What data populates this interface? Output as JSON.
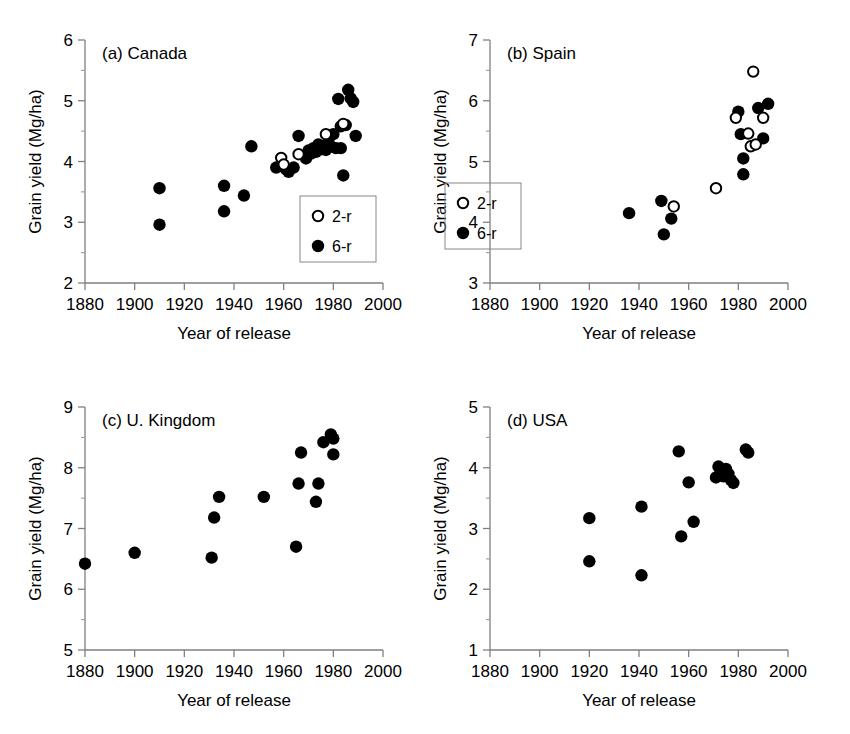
{
  "figure": {
    "title": "",
    "background_color": "#ffffff",
    "panel_count": 4
  },
  "common": {
    "xlabel": "Year of release",
    "ylabel": "Grain yield (Mg/ha)",
    "xticks": [
      1880,
      1900,
      1920,
      1940,
      1960,
      1980,
      2000
    ],
    "xlim": [
      1880,
      2000
    ],
    "legend_entries": [
      {
        "label": "2-r",
        "marker": "open-circle"
      },
      {
        "label": "6-r",
        "marker": "filled-circle"
      }
    ]
  },
  "chart_data": [
    {
      "type": "scatter",
      "id": "panel-a",
      "title": "(a) Canada",
      "xlabel": "Year of release",
      "ylabel": "Grain yield (Mg/ha)",
      "xlim": [
        1880,
        2000
      ],
      "ylim": [
        2,
        6
      ],
      "xticks": [
        1880,
        1900,
        1920,
        1940,
        1960,
        1980,
        2000
      ],
      "yticks": [
        2,
        3,
        4,
        5,
        6
      ],
      "grid": false,
      "legend_position": "bottom-right",
      "series": [
        {
          "name": "6-r",
          "marker": "filled-circle",
          "points": [
            [
              1910,
              3.56
            ],
            [
              1910,
              2.96
            ],
            [
              1936,
              3.6
            ],
            [
              1936,
              3.18
            ],
            [
              1944,
              3.44
            ],
            [
              1947,
              4.25
            ],
            [
              1957,
              3.9
            ],
            [
              1959,
              3.93
            ],
            [
              1961,
              3.87
            ],
            [
              1962,
              3.83
            ],
            [
              1964,
              3.9
            ],
            [
              1966,
              4.42
            ],
            [
              1969,
              4.05
            ],
            [
              1970,
              4.18
            ],
            [
              1971,
              4.13
            ],
            [
              1972,
              4.22
            ],
            [
              1973,
              4.16
            ],
            [
              1974,
              4.28
            ],
            [
              1975,
              4.2
            ],
            [
              1976,
              4.24
            ],
            [
              1977,
              4.19
            ],
            [
              1978,
              4.32
            ],
            [
              1979,
              4.25
            ],
            [
              1980,
              4.45
            ],
            [
              1981,
              4.22
            ],
            [
              1982,
              5.03
            ],
            [
              1983,
              4.58
            ],
            [
              1983,
              4.22
            ],
            [
              1984,
              3.77
            ],
            [
              1985,
              4.6
            ],
            [
              1986,
              5.18
            ],
            [
              1987,
              5.04
            ],
            [
              1988,
              4.98
            ],
            [
              1989,
              4.42
            ]
          ]
        },
        {
          "name": "2-r",
          "marker": "open-circle",
          "points": [
            [
              1959,
              4.06
            ],
            [
              1960,
              3.95
            ],
            [
              1966,
              4.12
            ],
            [
              1977,
              4.45
            ],
            [
              1984,
              4.62
            ]
          ]
        }
      ]
    },
    {
      "type": "scatter",
      "id": "panel-b",
      "title": "(b) Spain",
      "xlabel": "Year of release",
      "ylabel": "Grain yield (Mg/ha)",
      "xlim": [
        1880,
        2000
      ],
      "ylim": [
        3,
        7
      ],
      "xticks": [
        1880,
        1900,
        1920,
        1940,
        1960,
        1980,
        2000
      ],
      "yticks": [
        3,
        4,
        5,
        6,
        7
      ],
      "grid": false,
      "legend_position": "left",
      "series": [
        {
          "name": "6-r",
          "marker": "filled-circle",
          "points": [
            [
              1936,
              4.15
            ],
            [
              1949,
              4.35
            ],
            [
              1950,
              3.8
            ],
            [
              1953,
              4.06
            ],
            [
              1980,
              5.82
            ],
            [
              1981,
              5.45
            ],
            [
              1982,
              5.05
            ],
            [
              1982,
              4.79
            ],
            [
              1988,
              5.88
            ],
            [
              1990,
              5.38
            ],
            [
              1992,
              5.95
            ]
          ]
        },
        {
          "name": "2-r",
          "marker": "open-circle",
          "points": [
            [
              1954,
              4.26
            ],
            [
              1971,
              4.56
            ],
            [
              1979,
              5.72
            ],
            [
              1984,
              5.46
            ],
            [
              1985,
              5.25
            ],
            [
              1986,
              6.48
            ],
            [
              1987,
              5.28
            ],
            [
              1990,
              5.72
            ]
          ]
        }
      ]
    },
    {
      "type": "scatter",
      "id": "panel-c",
      "title": "(c) U. Kingdom",
      "xlabel": "Year of release",
      "ylabel": "Grain yield (Mg/ha)",
      "xlim": [
        1880,
        2000
      ],
      "ylim": [
        5,
        9
      ],
      "xticks": [
        1880,
        1900,
        1920,
        1940,
        1960,
        1980,
        2000
      ],
      "yticks": [
        5,
        6,
        7,
        8,
        9
      ],
      "grid": false,
      "legend_position": "none",
      "series": [
        {
          "name": "6-r",
          "marker": "filled-circle",
          "points": [
            [
              1880,
              6.42
            ],
            [
              1900,
              6.6
            ],
            [
              1931,
              6.52
            ],
            [
              1932,
              7.18
            ],
            [
              1934,
              7.52
            ],
            [
              1952,
              7.52
            ],
            [
              1965,
              6.7
            ],
            [
              1966,
              7.74
            ],
            [
              1967,
              8.25
            ],
            [
              1973,
              7.44
            ],
            [
              1974,
              7.74
            ],
            [
              1976,
              8.42
            ],
            [
              1979,
              8.55
            ],
            [
              1980,
              8.48
            ],
            [
              1980,
              8.22
            ]
          ]
        }
      ]
    },
    {
      "type": "scatter",
      "id": "panel-d",
      "title": "(d) USA",
      "xlabel": "Year of release",
      "ylabel": "Grain yield (Mg/ha)",
      "xlim": [
        1880,
        2000
      ],
      "ylim": [
        1,
        5
      ],
      "xticks": [
        1880,
        1900,
        1920,
        1940,
        1960,
        1980,
        2000
      ],
      "yticks": [
        1,
        2,
        3,
        4,
        5
      ],
      "grid": false,
      "legend_position": "none",
      "series": [
        {
          "name": "6-r",
          "marker": "filled-circle",
          "points": [
            [
              1920,
              3.17
            ],
            [
              1920,
              2.46
            ],
            [
              1941,
              3.36
            ],
            [
              1941,
              2.23
            ],
            [
              1956,
              4.27
            ],
            [
              1957,
              2.87
            ],
            [
              1960,
              3.76
            ],
            [
              1962,
              3.11
            ],
            [
              1971,
              3.84
            ],
            [
              1972,
              4.02
            ],
            [
              1973,
              3.93
            ],
            [
              1974,
              3.86
            ],
            [
              1975,
              3.98
            ],
            [
              1976,
              3.9
            ],
            [
              1977,
              3.8
            ],
            [
              1978,
              3.75
            ],
            [
              1983,
              4.3
            ],
            [
              1984,
              4.25
            ]
          ]
        }
      ]
    }
  ]
}
